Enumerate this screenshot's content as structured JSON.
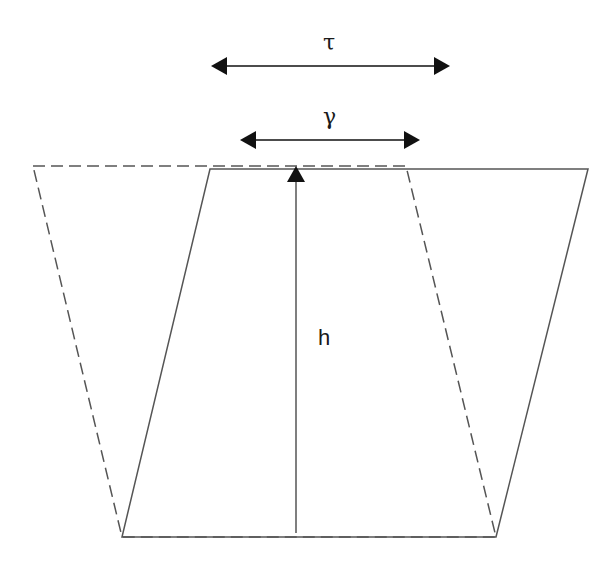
{
  "diagram": {
    "labels": {
      "tau": "τ",
      "gamma": "γ",
      "height": "h"
    },
    "colors": {
      "line": "#555555",
      "arrow": "#111111",
      "background": "#ffffff"
    },
    "shapes": {
      "solid_parallelogram": [
        [
          210,
          169
        ],
        [
          588,
          169
        ],
        [
          496,
          537
        ],
        [
          122,
          537
        ]
      ],
      "dashed_trapezoid": [
        [
          33,
          166
        ],
        [
          406,
          166
        ],
        [
          496,
          537
        ],
        [
          122,
          537
        ]
      ],
      "height_line": {
        "x": 296,
        "y_top": 168,
        "y_bottom": 533
      },
      "tau_arrow": {
        "y": 66,
        "x_start": 211,
        "x_end": 450
      },
      "gamma_arrow": {
        "y": 140,
        "x_start": 240,
        "x_end": 420
      }
    }
  }
}
